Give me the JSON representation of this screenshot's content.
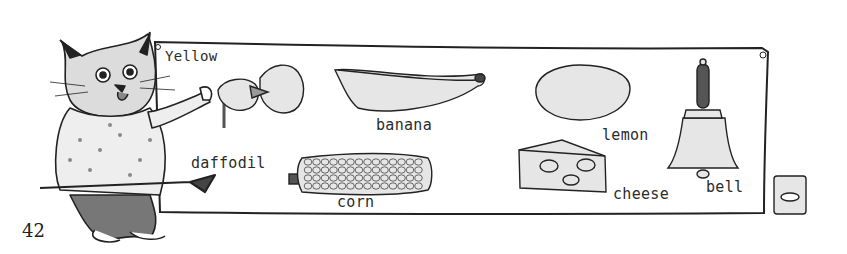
{
  "page": {
    "number": "42",
    "chart_title": "Yellow"
  },
  "items": [
    {
      "name": "daffodil",
      "label": "daffodil"
    },
    {
      "name": "banana",
      "label": "banana"
    },
    {
      "name": "lemon",
      "label": "lemon"
    },
    {
      "name": "bell",
      "label": "bell"
    },
    {
      "name": "corn",
      "label": "corn"
    },
    {
      "name": "cheese",
      "label": "cheese"
    }
  ],
  "colors": {
    "ink": "#2b2b2b",
    "fill_light": "#e6e6e6",
    "fill_dark": "#555555",
    "paper": "#ffffff"
  }
}
